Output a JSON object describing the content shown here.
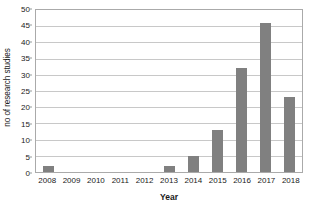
{
  "chart_data": {
    "type": "bar",
    "title": "",
    "xlabel": "Year",
    "ylabel": "no of research studies",
    "categories": [
      "2008",
      "2009",
      "2010",
      "2011",
      "2012",
      "2013",
      "2014",
      "2015",
      "2016",
      "2017",
      "2018"
    ],
    "values": [
      2,
      0,
      0,
      0,
      0,
      2,
      5,
      13,
      32,
      46,
      23
    ],
    "ylim": [
      0,
      50
    ],
    "ytick_step": 5,
    "yticks": [
      0,
      5,
      10,
      15,
      20,
      25,
      30,
      35,
      40,
      45,
      50
    ],
    "ytick_labels": [
      "0",
      "5",
      "10",
      "15",
      "20",
      "25",
      "30",
      "35",
      "40",
      "45",
      "50"
    ],
    "grid": true,
    "grid_axis": "y",
    "legend": false,
    "legend_position": "none",
    "bar_color": "#808080",
    "gridline_color": "#c8c8c8",
    "axis_color": "#aaaaaa",
    "background_color": "#ffffff",
    "text_color": "#1a1a1a",
    "series": [
      {
        "name": "no of research studies",
        "values": [
          2,
          0,
          0,
          0,
          0,
          2,
          5,
          13,
          32,
          46,
          23
        ]
      }
    ]
  }
}
